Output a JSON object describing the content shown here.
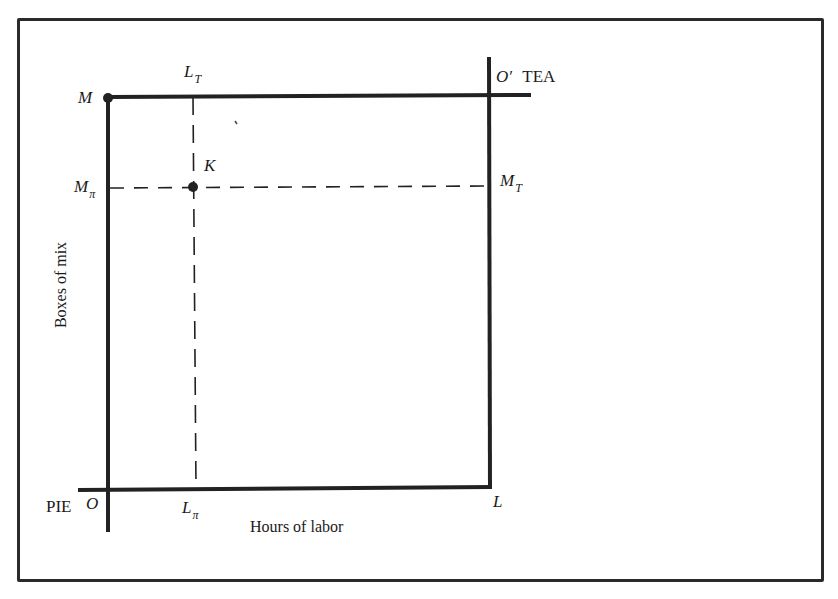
{
  "diagram": {
    "type": "edgeworth-box",
    "origins": {
      "bottom_left": {
        "label": "O",
        "owner": "PIE"
      },
      "top_right": {
        "label": "O′",
        "owner": "TEA"
      }
    },
    "axes": {
      "x_label": "Hours of labor",
      "y_label": "Boxes of mix"
    },
    "corner_labels": {
      "top_left": "M",
      "bottom_right": "L"
    },
    "point": {
      "label": "K"
    },
    "tick_labels": {
      "l_top": {
        "base": "L",
        "sub": "T"
      },
      "l_bottom": {
        "base": "L",
        "sub": "π"
      },
      "m_left": {
        "base": "M",
        "sub": "π"
      },
      "m_right": {
        "base": "M",
        "sub": "T"
      }
    },
    "colors": {
      "line": "#222222",
      "frame": "#2a2a2a",
      "background": "#ffffff"
    }
  }
}
